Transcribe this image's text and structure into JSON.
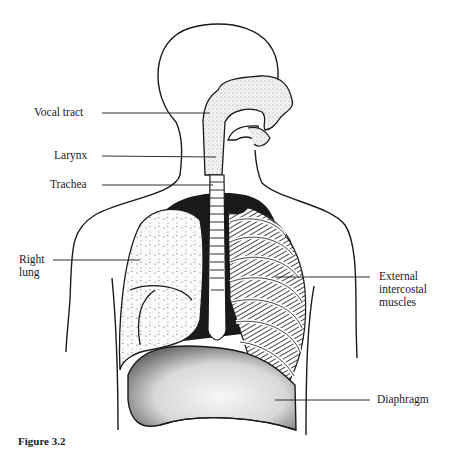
{
  "figure": {
    "caption": "Figure 3.2",
    "labels": {
      "vocal_tract": "Vocal tract",
      "larynx": "Larynx",
      "trachea": "Trachea",
      "right_lung": "Right\nlung",
      "external_intercostal": "External\nintercostal\nmuscles",
      "diaphragm": "Diaphragm"
    },
    "colors": {
      "ink": "#1a1a1a",
      "stipple": "#bdbdbd",
      "background": "#ffffff"
    }
  }
}
